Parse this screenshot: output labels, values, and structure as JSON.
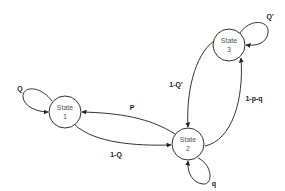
{
  "diagram": {
    "type": "state-transition",
    "states": [
      {
        "id": "s1",
        "line1": "State",
        "line2": "1"
      },
      {
        "id": "s2",
        "line1": "State",
        "line2": "2"
      },
      {
        "id": "s3",
        "line1": "State",
        "line2": "3"
      }
    ],
    "transitions": [
      {
        "from": "State 1",
        "to": "State 1",
        "label": "Q"
      },
      {
        "from": "State 2",
        "to": "State 1",
        "label": "P"
      },
      {
        "from": "State 1",
        "to": "State 2",
        "label": "1-Q"
      },
      {
        "from": "State 3",
        "to": "State 2",
        "label": "1-Q'"
      },
      {
        "from": "State 2",
        "to": "State 3",
        "label": "1-p-q"
      },
      {
        "from": "State 3",
        "to": "State 3",
        "label": "Q'"
      },
      {
        "from": "State 2",
        "to": "State 2",
        "label": "q"
      }
    ]
  }
}
